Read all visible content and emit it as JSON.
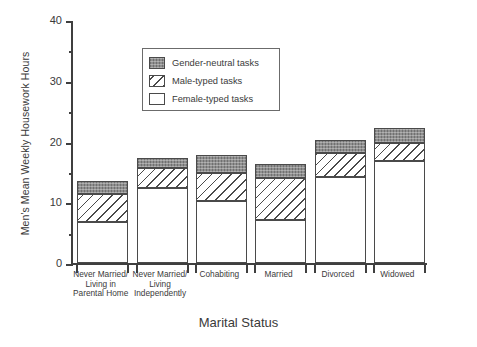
{
  "chart_data": {
    "type": "bar",
    "title": "",
    "xlabel": "Marital Status",
    "ylabel": "Men's Mean Weekly Housework Hours",
    "ylim": [
      0,
      40
    ],
    "ytick_labels": [
      "0",
      "10",
      "20",
      "30",
      "40"
    ],
    "ytick_values": [
      0,
      10,
      20,
      30,
      40
    ],
    "yminor_values": [
      5,
      15,
      25,
      35
    ],
    "grid": false,
    "stacked": true,
    "legend_position": "upper-left-inside",
    "categories": [
      "Never Married/ Living in Parental Home",
      "Never Married/ Living Independently",
      "Cohabiting",
      "Married",
      "Divorced",
      "Widowed"
    ],
    "category_lines": [
      [
        "Never Married/",
        "Living in",
        "Parental Home"
      ],
      [
        "Never Married/",
        "Living",
        "Independently"
      ],
      [
        "Cohabiting"
      ],
      [
        "Married"
      ],
      [
        "Divorced"
      ],
      [
        "Widowed"
      ]
    ],
    "series": [
      {
        "name": "Female-typed tasks",
        "pattern": "solid-white",
        "values": [
          6.8,
          12.3,
          10.2,
          7.1,
          14.2,
          16.8
        ]
      },
      {
        "name": "Male-typed tasks",
        "pattern": "diagonal-hatch",
        "values": [
          4.6,
          3.3,
          4.6,
          6.9,
          3.9,
          3.0
        ]
      },
      {
        "name": "Gender-neutral tasks",
        "pattern": "gray-stipple",
        "values": [
          2.1,
          1.7,
          3.0,
          2.3,
          2.1,
          2.4
        ]
      }
    ],
    "totals": [
      13.5,
      17.3,
      17.8,
      16.3,
      20.2,
      22.2
    ],
    "cumulative_tops": [
      {
        "female": 6.8,
        "male": 11.4,
        "total": 13.5
      },
      {
        "female": 12.3,
        "male": 15.6,
        "total": 17.3
      },
      {
        "female": 10.2,
        "male": 14.8,
        "total": 17.8
      },
      {
        "female": 7.1,
        "male": 14.0,
        "total": 16.3
      },
      {
        "female": 14.2,
        "male": 18.1,
        "total": 20.2
      },
      {
        "female": 16.8,
        "male": 19.8,
        "total": 22.2
      }
    ]
  },
  "legend": {
    "items": [
      {
        "label": "Gender-neutral tasks",
        "swatch": "gray-stipple"
      },
      {
        "label": "Male-typed tasks",
        "swatch": "diagonal-hatch"
      },
      {
        "label": "Female-typed tasks",
        "swatch": "solid-white"
      }
    ]
  },
  "colors": {
    "axis": "#3f3f3f",
    "text": "#3a3a3a",
    "neutral_fill": "#8f8f8f",
    "hatch_line": "#4a4a4a",
    "female_fill": "#ffffff",
    "background": "#ffffff"
  }
}
